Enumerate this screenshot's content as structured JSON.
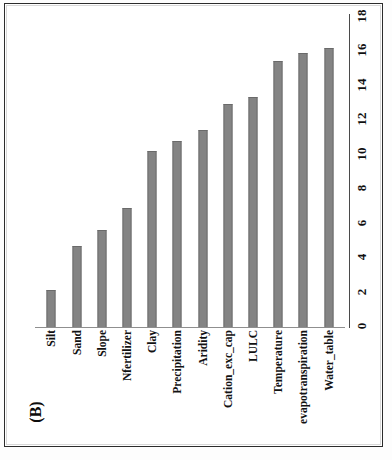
{
  "figure": {
    "panel_label": "(B)"
  },
  "chart_data": {
    "type": "bar",
    "title": "",
    "xlabel": "",
    "ylabel": "",
    "orientation": "vertical",
    "grid": false,
    "legend": null,
    "ylim": [
      0,
      18
    ],
    "yticks": [
      18,
      16,
      14,
      12,
      10,
      8,
      6,
      4,
      2,
      0
    ],
    "ytick_labels": [
      "18",
      "16",
      "14",
      "12",
      "10",
      "8",
      "6",
      "4",
      "2",
      "0"
    ],
    "bar_color": "#848484",
    "axis_color": "#4a4a4a",
    "categories": [
      "Silt",
      "Sand",
      "Slope",
      "Nfertilizer",
      "Clay",
      "Precipitation",
      "Aridity",
      "Cation_exc_cap",
      "LULC",
      "Temperature",
      "evapotranspiration",
      "Water_table"
    ],
    "values": [
      2.1,
      4.7,
      5.6,
      6.9,
      10.2,
      10.8,
      11.4,
      12.9,
      13.3,
      15.4,
      15.9,
      16.2
    ]
  }
}
